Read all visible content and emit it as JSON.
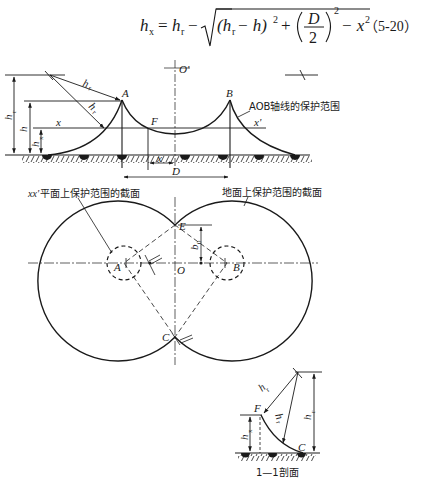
{
  "formula": {
    "lhs": "h",
    "lhs_sub": "x",
    "equals": "=",
    "term1": "h",
    "term1_sub": "r",
    "minus": "−",
    "inner_a": "(h",
    "inner_a_sub": "r",
    "inner_b": " − h)",
    "sq1": "2",
    "plus": "+",
    "frac_num": "D",
    "frac_den": "2",
    "sq2": "2",
    "minus2": "− x",
    "sq3": "2",
    "equation_number": "（5-20）"
  },
  "elevation": {
    "labels": {
      "O_prime": "O'",
      "A": "A",
      "B": "B",
      "F": "F",
      "x_left": "x",
      "x_right": "x'",
      "x_dim": "x",
      "D_dim": "D",
      "h_r_radius1": "h",
      "h_r_radius1_sub": "r",
      "h_r_radius2": "h",
      "h_r_radius2_sub": "r",
      "h_r_height": "h",
      "h_r_height_sub": "r",
      "h_height": "h",
      "h_x_height": "h",
      "h_x_height_sub": "x",
      "aob_callout": "AOB轴线的保护范围"
    }
  },
  "plan": {
    "labels": {
      "xx_callout_prefix": "xx'",
      "xx_callout": " 平面上保护范围的截面",
      "ground_callout": "地面上保护范围的截面",
      "A": "A",
      "B": "B",
      "O": "O",
      "E": "E",
      "C": "C",
      "b0": "b",
      "b0_sub": "0"
    }
  },
  "section": {
    "title": "1—1剖面",
    "labels": {
      "F": "F",
      "C": "C",
      "h_r_radius1": "h",
      "h_r_radius1_sub": "r",
      "h_r_radius2": "h",
      "h_r_radius2_sub": "r",
      "h_r_height": "h",
      "h_r_height_sub": "r",
      "h_x_height": "h",
      "h_x_height_sub": "x"
    }
  }
}
